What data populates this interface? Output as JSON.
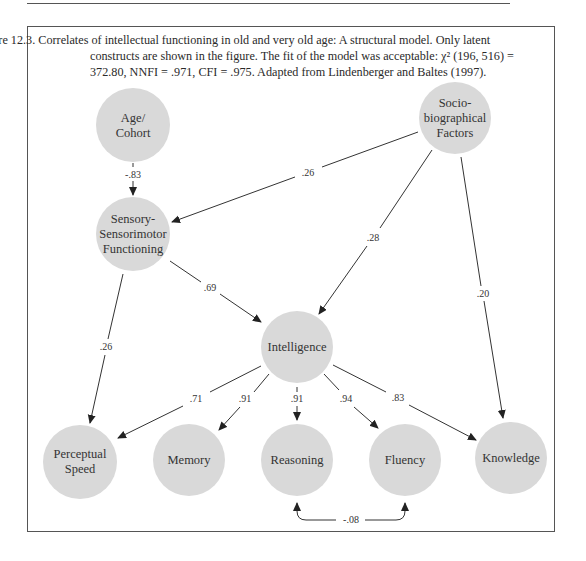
{
  "caption": {
    "lead": "Figure 12.3.",
    "lines": [
      "Correlates of intellectual functioning in old and very old age: A structural model. Only latent",
      "constructs are shown in the figure. The fit of the model was acceptable: χ² (196, 516) =",
      "372.80, NNFI = .971, CFI = .975. Adapted from Lindenberger and Baltes (1997)."
    ]
  },
  "colors": {
    "node_fill": "#d9d9d9",
    "edge": "#333333",
    "border": "#555555"
  },
  "nodes": {
    "age": {
      "lines": [
        "Age/",
        "Cohort"
      ]
    },
    "socio": {
      "lines": [
        "Socio-",
        "biographical",
        "Factors"
      ]
    },
    "sensory": {
      "lines": [
        "Sensory-",
        "Sensorimotor",
        "Functioning"
      ]
    },
    "intelligence": {
      "lines": [
        "Intelligence"
      ]
    },
    "perceptual": {
      "lines": [
        "Perceptual",
        "Speed"
      ]
    },
    "memory": {
      "lines": [
        "Memory"
      ]
    },
    "reasoning": {
      "lines": [
        "Reasoning"
      ]
    },
    "fluency": {
      "lines": [
        "Fluency"
      ]
    },
    "knowledge": {
      "lines": [
        "Knowledge"
      ]
    }
  },
  "edges": {
    "age_sensory": "-.83",
    "socio_sensory": ".26",
    "socio_intelligence": ".28",
    "socio_knowledge": ".20",
    "sensory_intelligence": ".69",
    "sensory_perceptual": ".26",
    "intelligence_perceptual": ".71",
    "intelligence_memory": ".91",
    "intelligence_reasoning": ".91",
    "intelligence_fluency": ".94",
    "intelligence_knowledge": ".83",
    "reasoning_fluency": "-.08"
  }
}
